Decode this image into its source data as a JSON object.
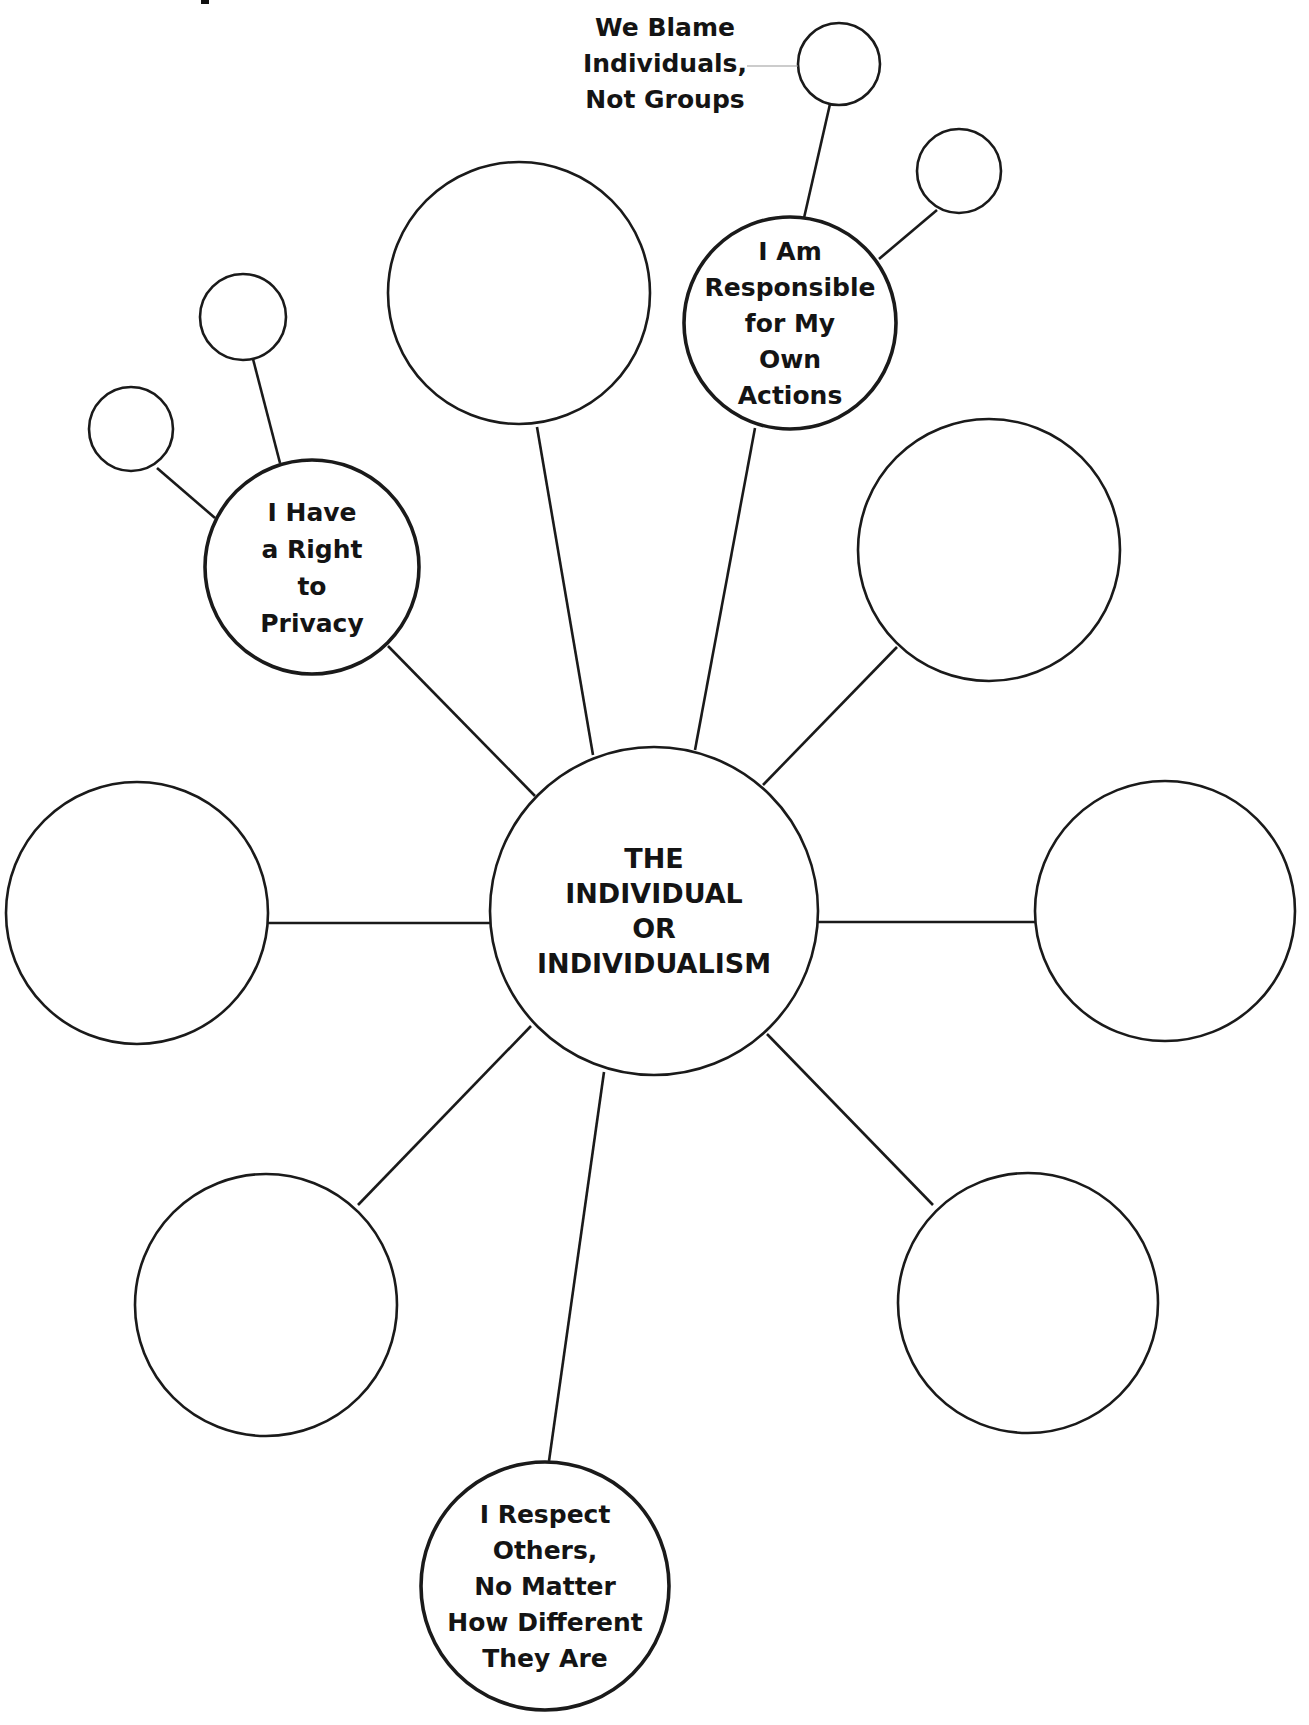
{
  "diagram": {
    "stroke_color": "#1a1a1a",
    "background": "#ffffff",
    "center_node": {
      "id": "center",
      "cx": 654,
      "cy": 911,
      "r": 164,
      "lines": [
        "THE",
        "INDIVIDUAL",
        "OR",
        "INDIVIDUALISM"
      ],
      "font_size": 27,
      "line_height": 35
    },
    "labeled_nodes": [
      {
        "id": "responsible",
        "cx": 790,
        "cy": 323,
        "r": 106,
        "lines": [
          "I Am",
          "Responsible",
          "for My",
          "Own",
          "Actions"
        ],
        "font_size": 25,
        "line_height": 36
      },
      {
        "id": "privacy",
        "cx": 312,
        "cy": 567,
        "r": 107,
        "lines": [
          "I Have",
          "a Right",
          "to",
          "Privacy"
        ],
        "font_size": 25,
        "line_height": 37
      },
      {
        "id": "respect",
        "cx": 545,
        "cy": 1586,
        "r": 124,
        "lines": [
          "I Respect",
          "Others,",
          "No Matter",
          "How Different",
          "They Are"
        ],
        "font_size": 25,
        "line_height": 36
      }
    ],
    "empty_nodes": [
      {
        "id": "top-large",
        "cx": 519,
        "cy": 293,
        "r": 131
      },
      {
        "id": "upper-right",
        "cx": 989,
        "cy": 550,
        "r": 131
      },
      {
        "id": "right",
        "cx": 1165,
        "cy": 911,
        "r": 130
      },
      {
        "id": "left",
        "cx": 137,
        "cy": 913,
        "r": 131
      },
      {
        "id": "bottom-left",
        "cx": 266,
        "cy": 1305,
        "r": 131
      },
      {
        "id": "bottom-right",
        "cx": 1028,
        "cy": 1303,
        "r": 130
      },
      {
        "id": "responsible-sub-1",
        "cx": 839,
        "cy": 64,
        "r": 41
      },
      {
        "id": "responsible-sub-2",
        "cx": 959,
        "cy": 171,
        "r": 42
      },
      {
        "id": "privacy-sub-1",
        "cx": 243,
        "cy": 317,
        "r": 43
      },
      {
        "id": "privacy-sub-2",
        "cx": 131,
        "cy": 429,
        "r": 42
      }
    ],
    "connectors": [
      {
        "id": "center-to-privacy",
        "x1": 535,
        "y1": 796,
        "x2": 388,
        "y2": 646
      },
      {
        "id": "center-to-top-large",
        "x1": 593,
        "y1": 755,
        "x2": 537,
        "y2": 427
      },
      {
        "id": "center-to-responsible",
        "x1": 695,
        "y1": 750,
        "x2": 755,
        "y2": 428
      },
      {
        "id": "center-to-upper-right",
        "x1": 763,
        "y1": 785,
        "x2": 897,
        "y2": 647
      },
      {
        "id": "center-to-left",
        "x1": 491,
        "y1": 923,
        "x2": 268,
        "y2": 923
      },
      {
        "id": "center-to-right",
        "x1": 818,
        "y1": 922,
        "x2": 1036,
        "y2": 922
      },
      {
        "id": "center-to-bottom-left",
        "x1": 531,
        "y1": 1026,
        "x2": 358,
        "y2": 1205
      },
      {
        "id": "center-to-bottom-right",
        "x1": 767,
        "y1": 1034,
        "x2": 933,
        "y2": 1205
      },
      {
        "id": "center-to-respect",
        "x1": 604,
        "y1": 1072,
        "x2": 549,
        "y2": 1461
      },
      {
        "id": "responsible-to-sub-1",
        "x1": 804,
        "y1": 218,
        "x2": 830,
        "y2": 104
      },
      {
        "id": "responsible-to-sub-2",
        "x1": 879,
        "y1": 259,
        "x2": 937,
        "y2": 210
      },
      {
        "id": "privacy-to-sub-1",
        "x1": 280,
        "y1": 463,
        "x2": 253,
        "y2": 359
      },
      {
        "id": "privacy-to-sub-2",
        "x1": 215,
        "y1": 518,
        "x2": 157,
        "y2": 468
      }
    ],
    "example_annotation": {
      "id": "we-blame",
      "lines": [
        "We Blame",
        "Individuals,",
        "Not Groups"
      ],
      "x": 665,
      "y_first": 36,
      "line_height": 36,
      "font_size": 25,
      "pointer": {
        "x1": 747,
        "y1": 66,
        "x2": 798,
        "y2": 66
      }
    },
    "edge_fragment": {
      "x": 201,
      "y": 0,
      "w": 8,
      "h": 4
    }
  }
}
